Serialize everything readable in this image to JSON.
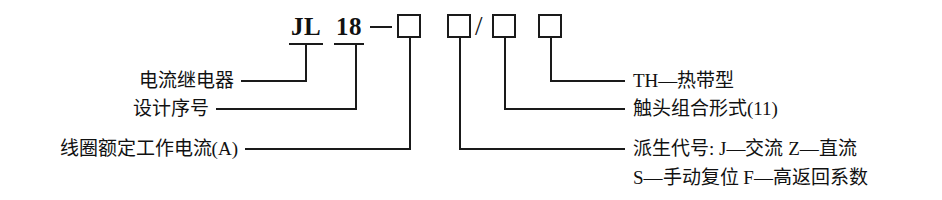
{
  "diagram": {
    "code": {
      "series_prefix": "JL",
      "design_number": "18",
      "dash": "—",
      "slash": "/"
    },
    "labels_left": [
      {
        "text": "电流继电器"
      },
      {
        "text": "设计序号"
      },
      {
        "text": "线圈额定工作电流(A)"
      }
    ],
    "labels_right": [
      {
        "text": "TH—热带型"
      },
      {
        "text": "触头组合形式(11)"
      },
      {
        "text": "派生代号: J—交流  Z—直流"
      },
      {
        "text": "S—手动复位  F—高返回系数"
      }
    ],
    "colors": {
      "line": "#1a1a1a",
      "text": "#111111",
      "background": "#ffffff"
    }
  }
}
